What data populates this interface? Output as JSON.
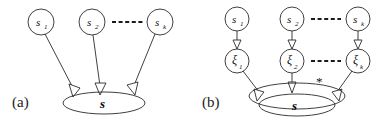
{
  "figure": {
    "type": "diagram",
    "background_color": "#ffffff",
    "stroke_color": "#2b2b2b"
  },
  "panels": [
    {
      "id": "a",
      "label": "(a)",
      "source_nodes": [
        {
          "id": "s1",
          "base": "s",
          "sub": "1",
          "cx": 41,
          "cy": 22,
          "r": 13
        },
        {
          "id": "s2",
          "base": "s",
          "sub": "2",
          "cx": 92,
          "cy": 22,
          "r": 13
        },
        {
          "id": "sk",
          "base": "s",
          "sub": "k",
          "cx": 160,
          "cy": 22,
          "r": 13
        }
      ],
      "ellipsis": {
        "label": "-----",
        "x1": 112,
        "x2": 143,
        "y": 22
      },
      "aggregate": {
        "id": "s-agg",
        "label": "s",
        "cx": 104,
        "cy": 103,
        "rx": 41,
        "ry": 11
      },
      "edges": [
        {
          "from": "s1",
          "to": "s-agg"
        },
        {
          "from": "s2",
          "to": "s-agg"
        },
        {
          "from": "sk",
          "to": "s-agg"
        }
      ]
    },
    {
      "id": "b",
      "label": "(b)",
      "source_nodes": [
        {
          "id": "b-s1",
          "base": "s",
          "sub": "1",
          "cx": 237,
          "cy": 19,
          "r": 12
        },
        {
          "id": "b-s2",
          "base": "s",
          "sub": "2",
          "cx": 292,
          "cy": 19,
          "r": 12
        },
        {
          "id": "b-sk",
          "base": "s",
          "sub": "k",
          "cx": 358,
          "cy": 19,
          "r": 12
        }
      ],
      "ellipsis_top": {
        "label": "-----",
        "x1": 311,
        "x2": 341,
        "y": 19
      },
      "latent_nodes": [
        {
          "id": "xi1",
          "base": "ξ",
          "sub": "1",
          "cx": 237,
          "cy": 61,
          "r": 12
        },
        {
          "id": "xi2",
          "base": "ξ",
          "sub": "2",
          "cx": 292,
          "cy": 61,
          "r": 12
        },
        {
          "id": "xik",
          "base": "ξ",
          "sub": "k",
          "cx": 358,
          "cy": 61,
          "r": 12
        }
      ],
      "ellipsis_mid": {
        "label": "-----",
        "x1": 311,
        "x2": 341,
        "y": 61
      },
      "outer_aggregate": {
        "id": "b-outer",
        "cx": 297,
        "cy": 96,
        "rx": 48,
        "ry": 13
      },
      "inner_aggregate": {
        "id": "b-inner",
        "label": "s",
        "cx": 297,
        "cy": 105,
        "rx": 38,
        "ry": 11
      },
      "annotation": {
        "label": "*",
        "x": 320,
        "y": 83
      },
      "edges": [
        {
          "from": "b-s1",
          "to": "xi1"
        },
        {
          "from": "b-s2",
          "to": "xi2"
        },
        {
          "from": "b-sk",
          "to": "xik"
        },
        {
          "from": "xi1",
          "to": "b-inner"
        },
        {
          "from": "xi2",
          "to": "b-outer"
        },
        {
          "from": "xik",
          "to": "b-inner"
        }
      ]
    }
  ]
}
